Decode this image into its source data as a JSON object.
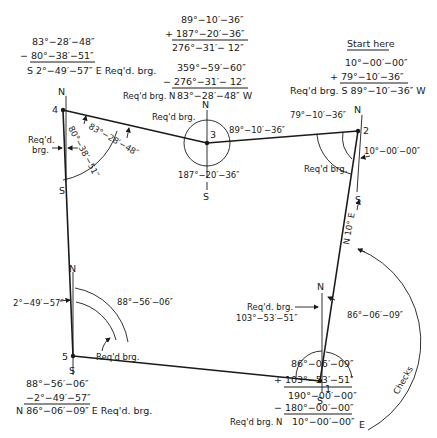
{
  "diagram": {
    "start_label": "Start here",
    "compass": {
      "north": "N",
      "south": "S"
    },
    "stations": [
      {
        "id": "1",
        "label": "1"
      },
      {
        "id": "2",
        "label": "2"
      },
      {
        "id": "3",
        "label": "3"
      },
      {
        "id": "4",
        "label": "4"
      },
      {
        "id": "5",
        "label": "5"
      }
    ],
    "angle_labels": {
      "st4_bearing": "80°−38′−51″",
      "st4_interior": "83°−28′−48″",
      "st4_reqd": "Req'd.",
      "st4_reqd2": "brg.",
      "st3_reqd": "Req'd brg.",
      "st3_east": "89°−10′−36″",
      "st3_south": "187°−20′−36″",
      "st2_interior": "79°−10′−36″",
      "st2_bearing": "10°−00′−00″",
      "st2_reqd": "Req'd brg.",
      "st5_bearing": "2°−49′−57″",
      "st5_interior": "88°−56′−06″",
      "st5_reqd": "Req'd brg.",
      "st1_reqd": "Req'd. brg.",
      "st1_interior": "103°−53′−51″",
      "st1_east": "86°−06′−09″",
      "leg_12": "N 10° E",
      "checks": "Checks"
    },
    "computations": {
      "top_left": {
        "lines": [
          "83°−28′−48″",
          "− 80°−38′−51″"
        ],
        "result": "S 2°−49′−57″ E Req'd. brg."
      },
      "top_center_sum": {
        "lines": [
          "89°−10′−36″",
          "+ 187°−20′−36″"
        ],
        "result": "276°−31′− 12″"
      },
      "top_center_diff": {
        "lines": [
          "359°−59′−60″",
          "− 276°−31′− 12″"
        ],
        "result_prefix": "Req'd brg. N",
        "result": "83°−28′−48″ W"
      },
      "top_right": {
        "lines": [
          "10°−00′−00″",
          "+ 79°−10′−36″"
        ],
        "result": "Req'd brg. S 89°−10′−36″ W"
      },
      "bottom_left": {
        "lines": [
          "88°−56′−06″",
          "−2°−49′−57″"
        ],
        "result": "N 86°−06′−09″ E Req'd. brg."
      },
      "bottom_right": {
        "lines": [
          "86°−06′−09″",
          "+ 103°−53′−51″"
        ],
        "mid": "190°−00′−00″",
        "lines2": [
          "− 180°−00′−00″"
        ],
        "result_prefix": "Req'd brg. N",
        "result": "10°−00′−00″",
        "result_suffix": "E"
      }
    }
  }
}
